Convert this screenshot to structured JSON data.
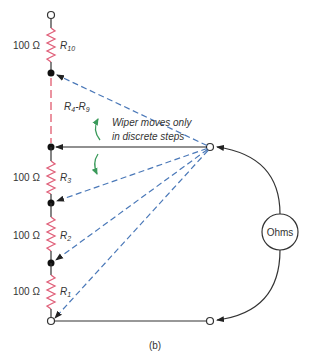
{
  "diagram": {
    "caption": "(b)",
    "resistors": [
      {
        "id": "R10",
        "name": "R",
        "sub": "10",
        "value": "100 Ω"
      },
      {
        "id": "R3",
        "name": "R",
        "sub": "3",
        "value": "100 Ω"
      },
      {
        "id": "R2",
        "name": "R",
        "sub": "2",
        "value": "100 Ω"
      },
      {
        "id": "R1",
        "name": "R",
        "sub": "1",
        "value": "100 Ω"
      }
    ],
    "range_label": {
      "a": "R",
      "a_sub": "4",
      "dash": "-",
      "b": "R",
      "b_sub": "9"
    },
    "annotation": {
      "line1": "Wiper moves only",
      "line2": "in discrete steps"
    },
    "meter_label": "Ohms",
    "colors": {
      "wire": "#333333",
      "resistor": "#e0607a",
      "dashed_range": "#e05a6e",
      "wiper_dashed": "#4a78b8",
      "arrow_green": "#3a9a5a",
      "text": "#333333"
    }
  }
}
